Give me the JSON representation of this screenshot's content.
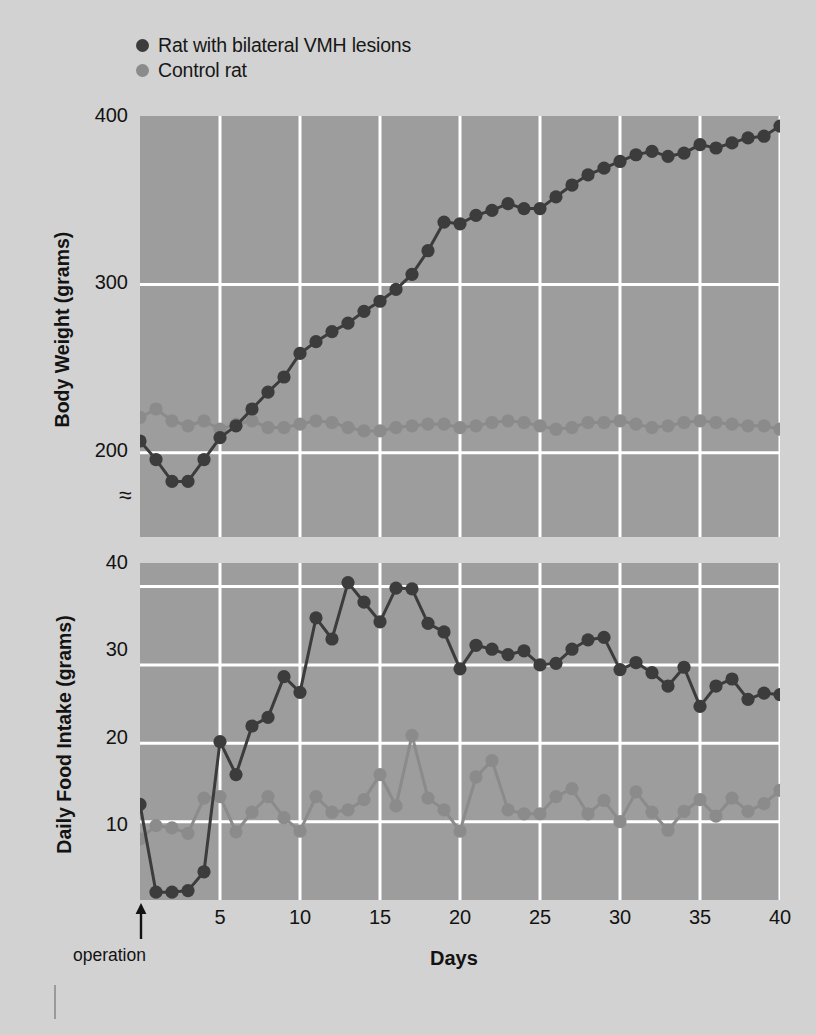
{
  "legend": {
    "items": [
      {
        "label": "Rat with bilateral VMH lesions",
        "color": "#3c3c3c",
        "key": "lesion"
      },
      {
        "label": "Control rat",
        "color": "#8b8b8b",
        "key": "control"
      }
    ]
  },
  "xaxis": {
    "title": "Days",
    "ticks": [
      5,
      10,
      15,
      20,
      25,
      30,
      35,
      40
    ],
    "range": [
      0,
      40
    ],
    "annotation": "operation",
    "annotation_day": 0
  },
  "break_symbol": "≈",
  "colors": {
    "page_background": "#d2d2d2",
    "plot_background": "#9d9d9d",
    "gridline": "#ffffff",
    "lesion_series": "#3c3c3c",
    "control_series": "#8b8b8b",
    "text": "#131313"
  },
  "chart_data": [
    {
      "type": "line",
      "title": "",
      "xlabel": "Days",
      "ylabel": "Body Weight (grams)",
      "xlim": [
        0,
        40
      ],
      "ylim": [
        150,
        400
      ],
      "yticks": [
        200,
        300,
        400
      ],
      "xticks": [
        5,
        10,
        15,
        20,
        25,
        30,
        35,
        40
      ],
      "grid": true,
      "axis_break": true,
      "legend_position": "above-plot",
      "x": [
        0,
        1,
        2,
        3,
        4,
        5,
        6,
        7,
        8,
        9,
        10,
        11,
        12,
        13,
        14,
        15,
        16,
        17,
        18,
        19,
        20,
        21,
        22,
        23,
        24,
        25,
        26,
        27,
        28,
        29,
        30,
        31,
        32,
        33,
        34,
        35,
        36,
        37,
        38,
        39,
        40
      ],
      "series": [
        {
          "name": "Rat with bilateral VMH lesions",
          "color": "#3c3c3c",
          "values": [
            207,
            196,
            183,
            183,
            196,
            209,
            216,
            226,
            236,
            245,
            259,
            266,
            272,
            277,
            284,
            290,
            297,
            306,
            320,
            337,
            336,
            341,
            344,
            348,
            345,
            345,
            352,
            359,
            365,
            369,
            373,
            377,
            379,
            376,
            378,
            383,
            381,
            384,
            387,
            388,
            394
          ]
        },
        {
          "name": "Control rat",
          "color": "#8b8b8b",
          "values": [
            221,
            226,
            219,
            216,
            219,
            214,
            217,
            219,
            215,
            215,
            217,
            219,
            218,
            215,
            213,
            213,
            215,
            216,
            217,
            217,
            215,
            216,
            218,
            219,
            218,
            216,
            214,
            215,
            218,
            218,
            219,
            217,
            215,
            216,
            218,
            219,
            218,
            217,
            216,
            216,
            214
          ]
        }
      ]
    },
    {
      "type": "line",
      "title": "",
      "xlabel": "Days",
      "ylabel": "Daily Food Intake (grams)",
      "xlim": [
        0,
        40
      ],
      "ylim": [
        0,
        43
      ],
      "yticks": [
        10,
        20,
        30,
        40
      ],
      "xticks": [
        5,
        10,
        15,
        20,
        25,
        30,
        35,
        40
      ],
      "grid": true,
      "legend_position": "above-plot",
      "x": [
        0,
        1,
        2,
        3,
        4,
        5,
        6,
        7,
        8,
        9,
        10,
        11,
        12,
        13,
        14,
        15,
        16,
        17,
        18,
        19,
        20,
        21,
        22,
        23,
        24,
        25,
        26,
        27,
        28,
        29,
        30,
        31,
        32,
        33,
        34,
        35,
        36,
        37,
        38,
        39,
        40
      ],
      "series": [
        {
          "name": "Rat with bilateral VMH lesions",
          "color": "#3c3c3c",
          "values": [
            12.2,
            1.0,
            1.0,
            1.2,
            3.6,
            20.2,
            16.0,
            22.2,
            23.3,
            28.5,
            26.5,
            36.0,
            33.3,
            40.5,
            38.0,
            35.5,
            39.8,
            39.7,
            35.3,
            34.2,
            29.5,
            32.5,
            32.0,
            31.3,
            31.8,
            30.0,
            30.2,
            32.0,
            33.2,
            33.5,
            29.4,
            30.3,
            29.0,
            27.3,
            29.7,
            24.7,
            27.3,
            28.2,
            25.6,
            26.4,
            26.2
          ]
        },
        {
          "name": "Control rat",
          "color": "#8b8b8b",
          "values": [
            7.8,
            9.5,
            9.2,
            8.5,
            13.0,
            13.2,
            8.7,
            11.2,
            13.2,
            10.5,
            8.8,
            13.2,
            11.2,
            11.5,
            12.8,
            16.0,
            12.0,
            21.0,
            13.0,
            11.5,
            8.8,
            15.7,
            17.8,
            11.5,
            11.0,
            11.0,
            13.2,
            14.2,
            11.0,
            12.7,
            10.0,
            13.8,
            11.2,
            8.9,
            11.3,
            12.8,
            10.7,
            13.0,
            11.3,
            12.3,
            14.0
          ]
        }
      ]
    }
  ]
}
